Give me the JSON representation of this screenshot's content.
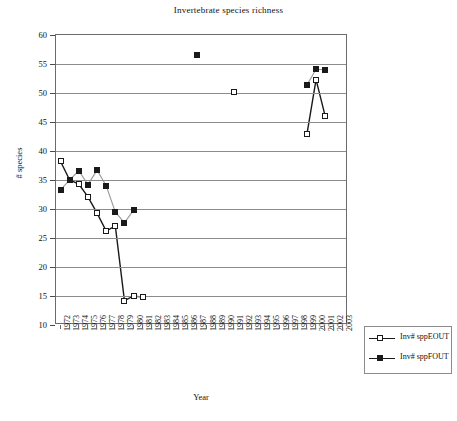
{
  "chart_data": {
    "type": "line",
    "title": "Invertebrate species richness",
    "xlabel": "Year",
    "ylabel": "# species",
    "ylim": [
      10,
      60
    ],
    "yticks": [
      10,
      15,
      20,
      25,
      30,
      35,
      40,
      45,
      50,
      55,
      60
    ],
    "grid": true,
    "legend_position": "bottom-right",
    "x": [
      1972,
      1973,
      1974,
      1975,
      1976,
      1977,
      1978,
      1979,
      1980,
      1981,
      1982,
      1983,
      1984,
      1985,
      1986,
      1987,
      1988,
      1989,
      1990,
      1991,
      1992,
      1993,
      1994,
      1995,
      1996,
      1997,
      1998,
      1999,
      2000,
      2001,
      2002,
      2003
    ],
    "categories": [
      "1972",
      "1973",
      "1974",
      "1975",
      "1976",
      "1977",
      "1978",
      "1979",
      "1980",
      "1981",
      "1982",
      "1983",
      "1984",
      "1985",
      "1986",
      "1987",
      "1988",
      "1989",
      "1990",
      "1991",
      "1992",
      "1993",
      "1994",
      "1995",
      "1996",
      "1997",
      "1998",
      "1999",
      "2000",
      "2001",
      "2002",
      "2003"
    ],
    "series": [
      {
        "name": "Inv# sppEOUT",
        "marker": "open-square",
        "points": [
          {
            "x": 1972,
            "y": 38.2
          },
          {
            "x": 1973,
            "y": 35.0
          },
          {
            "x": 1974,
            "y": 34.3
          },
          {
            "x": 1975,
            "y": 32.1
          },
          {
            "x": 1976,
            "y": 29.3
          },
          {
            "x": 1977,
            "y": 26.2
          },
          {
            "x": 1978,
            "y": 27.1
          },
          {
            "x": 1979,
            "y": 14.2
          },
          {
            "x": 1980,
            "y": 15.0
          },
          {
            "x": 1981,
            "y": 14.8
          },
          {
            "x": 1991,
            "y": 50.2
          },
          {
            "x": 1999,
            "y": 42.9
          },
          {
            "x": 2000,
            "y": 52.3
          },
          {
            "x": 2001,
            "y": 46.0
          }
        ]
      },
      {
        "name": "Inv# sppFOUT",
        "marker": "filled-square",
        "points": [
          {
            "x": 1972,
            "y": 33.3
          },
          {
            "x": 1973,
            "y": 35.0
          },
          {
            "x": 1974,
            "y": 36.6
          },
          {
            "x": 1975,
            "y": 34.2
          },
          {
            "x": 1976,
            "y": 36.7
          },
          {
            "x": 1977,
            "y": 34.0
          },
          {
            "x": 1978,
            "y": 29.5
          },
          {
            "x": 1979,
            "y": 27.6
          },
          {
            "x": 1980,
            "y": 29.8
          },
          {
            "x": 1987,
            "y": 56.5
          },
          {
            "x": 1999,
            "y": 51.4
          },
          {
            "x": 2000,
            "y": 54.1
          },
          {
            "x": 2001,
            "y": 54.0
          }
        ]
      }
    ]
  },
  "legend": {
    "items": [
      {
        "label": "Inv# sppEOUT",
        "marker": "open-square"
      },
      {
        "label": "Inv# sppFOUT",
        "marker": "filled-square"
      }
    ]
  },
  "colors": {
    "axis": "#6b6b6b",
    "grid": "#8c8c8c",
    "series_e": "#1a1a1a",
    "series_f": "#1a1a1a",
    "background": "#ffffff"
  }
}
